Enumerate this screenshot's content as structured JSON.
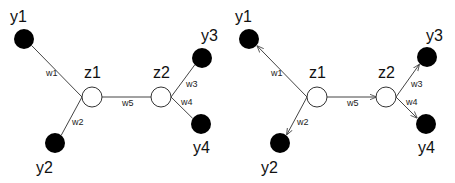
{
  "panels": [
    {
      "id": "undirected",
      "directed": false,
      "offset_x": 0,
      "nodes": [
        {
          "id": "y1",
          "label": "y1",
          "type": "observed",
          "x": 24,
          "y": 39,
          "lx": 10,
          "ly": 22
        },
        {
          "id": "y2",
          "label": "y2",
          "type": "observed",
          "x": 55,
          "y": 143,
          "lx": 36,
          "ly": 173
        },
        {
          "id": "y3",
          "label": "y3",
          "type": "observed",
          "x": 202,
          "y": 58,
          "lx": 201,
          "ly": 41
        },
        {
          "id": "y4",
          "label": "y4",
          "type": "observed",
          "x": 201,
          "y": 124,
          "lx": 193,
          "ly": 153
        },
        {
          "id": "z1",
          "label": "z1",
          "type": "latent",
          "x": 92,
          "y": 97,
          "lx": 84,
          "ly": 78
        },
        {
          "id": "z2",
          "label": "z2",
          "type": "latent",
          "x": 161,
          "y": 97,
          "lx": 153,
          "ly": 78
        }
      ],
      "edges": [
        {
          "label": "w1",
          "from": "z1",
          "to": "y1",
          "lx": 46,
          "ly": 76
        },
        {
          "label": "w2",
          "from": "z1",
          "to": "y2",
          "lx": 72,
          "ly": 125
        },
        {
          "label": "w5",
          "from": "z1",
          "to": "z2",
          "lx": 122,
          "ly": 106
        },
        {
          "label": "w3",
          "from": "z2",
          "to": "y3",
          "lx": 186,
          "ly": 87
        },
        {
          "label": "w4",
          "from": "z2",
          "to": "y4",
          "lx": 181,
          "ly": 105
        }
      ]
    },
    {
      "id": "directed",
      "directed": true,
      "offset_x": 225,
      "nodes": [
        {
          "id": "y1",
          "label": "y1",
          "type": "observed",
          "x": 249,
          "y": 39,
          "lx": 235,
          "ly": 22
        },
        {
          "id": "y2",
          "label": "y2",
          "type": "observed",
          "x": 280,
          "y": 143,
          "lx": 261,
          "ly": 173
        },
        {
          "id": "y3",
          "label": "y3",
          "type": "observed",
          "x": 427,
          "y": 57,
          "lx": 426,
          "ly": 41
        },
        {
          "id": "y4",
          "label": "y4",
          "type": "observed",
          "x": 426,
          "y": 124,
          "lx": 418,
          "ly": 153
        },
        {
          "id": "z1",
          "label": "z1",
          "type": "latent",
          "x": 317,
          "y": 97,
          "lx": 309,
          "ly": 78
        },
        {
          "id": "z2",
          "label": "z2",
          "type": "latent",
          "x": 386,
          "y": 97,
          "lx": 378,
          "ly": 78
        }
      ],
      "edges": [
        {
          "label": "w1",
          "from": "z1",
          "to": "y1",
          "lx": 271,
          "ly": 76
        },
        {
          "label": "w2",
          "from": "z1",
          "to": "y2",
          "lx": 297,
          "ly": 125
        },
        {
          "label": "w5",
          "from": "z1",
          "to": "z2",
          "lx": 347,
          "ly": 106
        },
        {
          "label": "w3",
          "from": "z2",
          "to": "y3",
          "lx": 411,
          "ly": 87
        },
        {
          "label": "w4",
          "from": "z2",
          "to": "y4",
          "lx": 406,
          "ly": 105
        }
      ]
    }
  ],
  "style": {
    "observed_color": "#000000",
    "latent_fill": "#ffffff",
    "edge_color": "#444444",
    "node_radius": 10
  }
}
